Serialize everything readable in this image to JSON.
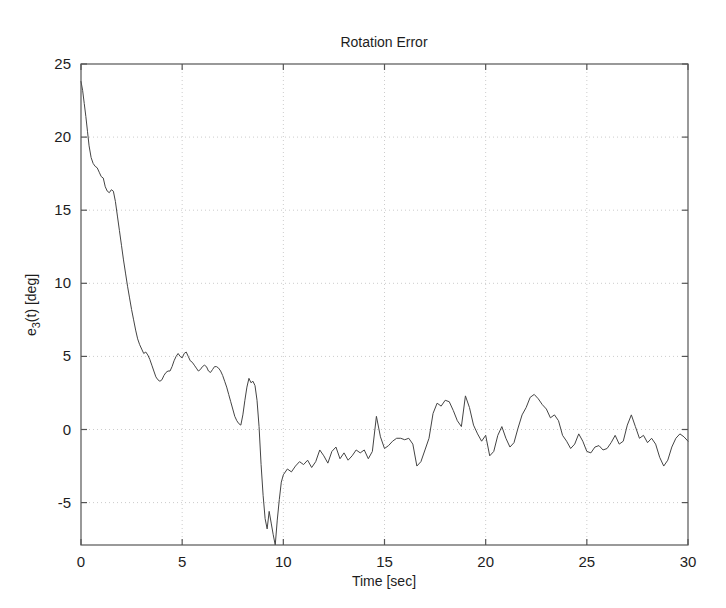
{
  "chart_data": {
    "type": "line",
    "title": "Rotation Error",
    "xlabel": "Time [sec]",
    "ylabel": "e_3(t) [deg]",
    "ylabel_parts": {
      "base": "e",
      "subscript": "3",
      "rest": "(t) [deg]"
    },
    "xlim": [
      0,
      30
    ],
    "ylim": [
      -7.9,
      25
    ],
    "xticks": [
      0,
      5,
      10,
      15,
      20,
      25,
      30
    ],
    "yticks": [
      -5,
      0,
      5,
      10,
      15,
      20,
      25
    ],
    "xtick_labels": [
      "0",
      "5",
      "10",
      "15",
      "20",
      "25",
      "30"
    ],
    "ytick_labels": [
      "-5",
      "0",
      "5",
      "10",
      "15",
      "20",
      "25"
    ],
    "grid": true,
    "grid_style": "dotted",
    "legend": null,
    "line_color": "#444444",
    "line_width": 1,
    "series": [
      {
        "name": "e_3(t)",
        "x": [
          0.0,
          0.08,
          0.16,
          0.24,
          0.32,
          0.4,
          0.5,
          0.6,
          0.7,
          0.8,
          0.9,
          1.0,
          1.1,
          1.2,
          1.3,
          1.4,
          1.5,
          1.6,
          1.7,
          1.8,
          1.9,
          2.0,
          2.1,
          2.2,
          2.3,
          2.4,
          2.5,
          2.6,
          2.7,
          2.8,
          2.9,
          3.0,
          3.1,
          3.2,
          3.3,
          3.4,
          3.5,
          3.6,
          3.7,
          3.8,
          3.9,
          4.0,
          4.1,
          4.2,
          4.3,
          4.4,
          4.5,
          4.6,
          4.7,
          4.8,
          4.9,
          5.0,
          5.1,
          5.2,
          5.3,
          5.4,
          5.5,
          5.6,
          5.7,
          5.8,
          5.9,
          6.0,
          6.1,
          6.2,
          6.3,
          6.4,
          6.5,
          6.6,
          6.7,
          6.8,
          6.9,
          7.0,
          7.1,
          7.2,
          7.3,
          7.4,
          7.5,
          7.6,
          7.7,
          7.8,
          7.9,
          8.0,
          8.1,
          8.2,
          8.3,
          8.4,
          8.5,
          8.6,
          8.7,
          8.8,
          8.9,
          9.0,
          9.1,
          9.2,
          9.3,
          9.4,
          9.5,
          9.6,
          9.7,
          9.8,
          9.9,
          10.0,
          10.2,
          10.4,
          10.6,
          10.8,
          11.0,
          11.2,
          11.4,
          11.6,
          11.8,
          12.0,
          12.2,
          12.4,
          12.6,
          12.8,
          13.0,
          13.2,
          13.4,
          13.6,
          13.8,
          14.0,
          14.2,
          14.4,
          14.6,
          14.8,
          15.0,
          15.2,
          15.4,
          15.6,
          15.8,
          16.0,
          16.2,
          16.4,
          16.6,
          16.8,
          17.0,
          17.2,
          17.4,
          17.6,
          17.8,
          18.0,
          18.2,
          18.4,
          18.6,
          18.8,
          19.0,
          19.2,
          19.4,
          19.6,
          19.8,
          20.0,
          20.2,
          20.4,
          20.6,
          20.8,
          21.0,
          21.2,
          21.4,
          21.6,
          21.8,
          22.0,
          22.2,
          22.4,
          22.6,
          22.8,
          23.0,
          23.2,
          23.4,
          23.6,
          23.8,
          24.0,
          24.2,
          24.4,
          24.6,
          24.8,
          25.0,
          25.2,
          25.4,
          25.6,
          25.8,
          26.0,
          26.2,
          26.4,
          26.6,
          26.8,
          27.0,
          27.2,
          27.4,
          27.6,
          27.8,
          28.0,
          28.2,
          28.4,
          28.6,
          28.8,
          29.0,
          29.2,
          29.4,
          29.6,
          29.8,
          30.0
        ],
        "y": [
          23.8,
          23.2,
          22.3,
          21.4,
          20.4,
          19.4,
          18.6,
          18.2,
          18.0,
          17.9,
          17.6,
          17.3,
          17.2,
          16.6,
          16.3,
          16.2,
          16.4,
          16.3,
          15.6,
          14.6,
          13.6,
          12.6,
          11.6,
          10.7,
          9.8,
          9.0,
          8.2,
          7.5,
          6.8,
          6.2,
          5.8,
          5.5,
          5.2,
          5.3,
          5.1,
          4.8,
          4.4,
          4.0,
          3.6,
          3.4,
          3.3,
          3.4,
          3.7,
          3.9,
          4.0,
          4.0,
          4.3,
          4.7,
          5.0,
          5.2,
          5.0,
          4.9,
          5.2,
          5.3,
          5.0,
          4.7,
          4.6,
          4.4,
          4.2,
          4.0,
          4.1,
          4.3,
          4.4,
          4.3,
          4.0,
          3.9,
          4.1,
          4.3,
          4.3,
          4.2,
          4.0,
          3.7,
          3.3,
          2.9,
          2.4,
          1.9,
          1.4,
          0.9,
          0.6,
          0.4,
          0.3,
          1.0,
          2.0,
          2.9,
          3.5,
          3.2,
          3.3,
          3.0,
          2.0,
          0.2,
          -2.4,
          -4.5,
          -6.1,
          -6.8,
          -5.6,
          -6.4,
          -7.2,
          -7.9,
          -6.2,
          -4.8,
          -3.6,
          -3.1,
          -2.7,
          -2.9,
          -2.5,
          -2.2,
          -2.4,
          -2.1,
          -2.6,
          -2.2,
          -1.4,
          -1.8,
          -2.3,
          -1.5,
          -1.2,
          -2.0,
          -1.6,
          -2.1,
          -1.8,
          -1.4,
          -1.6,
          -1.4,
          -2.0,
          -1.5,
          0.9,
          -0.5,
          -1.3,
          -1.1,
          -0.8,
          -0.6,
          -0.6,
          -0.7,
          -0.6,
          -1.0,
          -2.5,
          -2.2,
          -1.4,
          -0.6,
          1.1,
          1.8,
          1.6,
          2.0,
          1.9,
          1.3,
          0.6,
          0.2,
          2.3,
          1.5,
          0.3,
          -0.3,
          -0.8,
          -0.4,
          -1.8,
          -1.5,
          -0.4,
          0.2,
          -0.6,
          -1.2,
          -0.9,
          0.1,
          1.0,
          1.5,
          2.2,
          2.4,
          2.1,
          1.7,
          1.4,
          0.8,
          1.0,
          0.6,
          -0.4,
          -0.8,
          -1.3,
          -1.0,
          -0.3,
          -0.8,
          -1.5,
          -1.6,
          -1.2,
          -1.1,
          -1.4,
          -1.3,
          -0.9,
          -0.4,
          -1.0,
          -0.8,
          0.3,
          1.0,
          0.2,
          -0.6,
          -0.4,
          -0.9,
          -0.6,
          -1.0,
          -1.9,
          -2.5,
          -2.1,
          -1.2,
          -0.6,
          -0.3,
          -0.5,
          -0.8
        ]
      }
    ]
  },
  "figure": {
    "background": "#ffffff",
    "axis_color": "#555555",
    "grid_color": "#cccccc",
    "text_color": "#1d1d1d"
  }
}
